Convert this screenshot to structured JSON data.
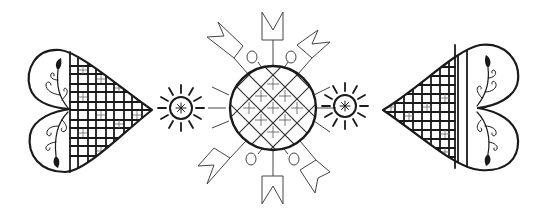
{
  "image": {
    "description": "Black-and-white folk-art line illustration",
    "background": "#ffffff",
    "ink_color": "#1a1a1a",
    "elements": [
      {
        "name": "left-heart",
        "pattern": "lattice-with-crosses",
        "decoration": "vine-with-leaves",
        "tip": "right"
      },
      {
        "name": "left-small-sun",
        "center_glyph": "asterisk"
      },
      {
        "name": "central-sun",
        "pattern": "diagonal-lattice-with-stars",
        "rays": 8,
        "ray_ends": "crown-shapes",
        "small_circles": 4
      },
      {
        "name": "right-small-sun",
        "center_glyph": "asterisk"
      },
      {
        "name": "right-heart",
        "pattern": "lattice-with-crosses",
        "decoration": "vine-with-leaves",
        "tip": "left"
      }
    ]
  }
}
